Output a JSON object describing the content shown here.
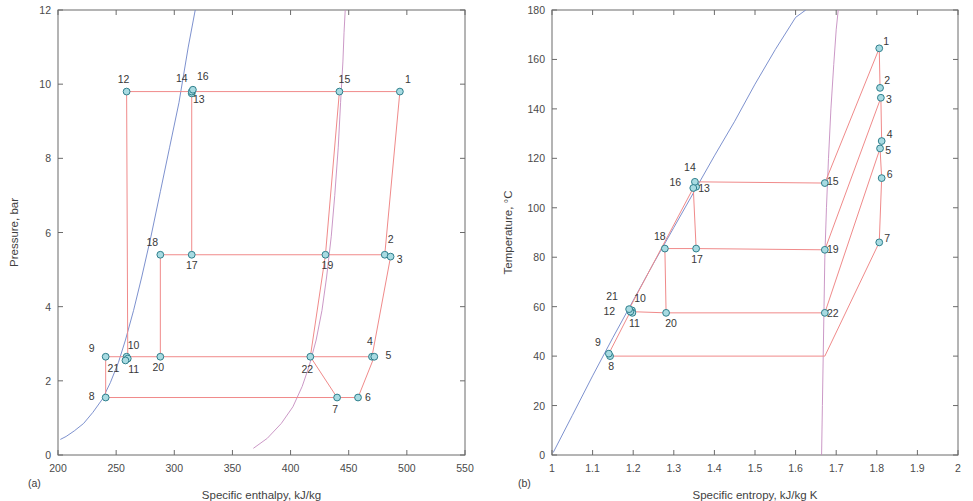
{
  "figure": {
    "panel_a_tag": "(a)",
    "panel_b_tag": "(b)"
  },
  "chart_data": [
    {
      "type": "line",
      "panel": "(a)",
      "title": "",
      "xlabel": "Specific enthalpy, kJ/kg",
      "ylabel": "Pressure, bar",
      "xlim": [
        200,
        550
      ],
      "ylim": [
        0,
        12
      ],
      "xticks": [
        200,
        250,
        300,
        350,
        400,
        450,
        500,
        550
      ],
      "yticks": [
        0,
        2,
        4,
        6,
        8,
        10,
        12
      ],
      "xtick_labels": [
        "200",
        "250",
        "300",
        "350",
        "400",
        "450",
        "500",
        "550"
      ],
      "ytick_labels": [
        "0",
        "2",
        "4",
        "6",
        "8",
        "10",
        "12"
      ],
      "grid": false,
      "legend": "none",
      "state_points": [
        {
          "label": "1",
          "x": 494,
          "y": 9.8,
          "lx": 8,
          "ly": -9
        },
        {
          "label": "2",
          "x": 481,
          "y": 5.4,
          "lx": 6,
          "ly": -12
        },
        {
          "label": "3",
          "x": 486,
          "y": 5.35,
          "lx": 9,
          "ly": 6
        },
        {
          "label": "4",
          "x": 470,
          "y": 2.65,
          "lx": -2,
          "ly": -12
        },
        {
          "label": "5",
          "x": 472,
          "y": 2.65,
          "lx": 14,
          "ly": 2
        },
        {
          "label": "6",
          "x": 458,
          "y": 1.55,
          "lx": 10,
          "ly": 3
        },
        {
          "label": "7",
          "x": 440,
          "y": 1.55,
          "lx": -2,
          "ly": 15
        },
        {
          "label": "8",
          "x": 241,
          "y": 1.55,
          "lx": -14,
          "ly": 2
        },
        {
          "label": "9",
          "x": 241,
          "y": 2.65,
          "lx": -14,
          "ly": -5
        },
        {
          "label": "10",
          "x": 259,
          "y": 2.65,
          "lx": 7,
          "ly": -8
        },
        {
          "label": "11",
          "x": 260,
          "y": 2.6,
          "lx": 6,
          "ly": 14
        },
        {
          "label": "12",
          "x": 259,
          "y": 9.8,
          "lx": -3,
          "ly": -9
        },
        {
          "label": "13",
          "x": 315,
          "y": 9.75,
          "lx": 7,
          "ly": 10
        },
        {
          "label": "14",
          "x": 315,
          "y": 9.8,
          "lx": -10,
          "ly": -10
        },
        {
          "label": "15",
          "x": 442,
          "y": 9.8,
          "lx": 5,
          "ly": -9
        },
        {
          "label": "16",
          "x": 316,
          "y": 9.85,
          "lx": 10,
          "ly": -10
        },
        {
          "label": "17",
          "x": 315,
          "y": 5.4,
          "lx": 0,
          "ly": 14
        },
        {
          "label": "18",
          "x": 288,
          "y": 5.4,
          "lx": -8,
          "ly": -9
        },
        {
          "label": "19",
          "x": 430,
          "y": 5.4,
          "lx": 2,
          "ly": 14
        },
        {
          "label": "20",
          "x": 288,
          "y": 2.65,
          "lx": -2,
          "ly": 14
        },
        {
          "label": "21",
          "x": 258,
          "y": 2.55,
          "lx": -12,
          "ly": 12
        },
        {
          "label": "22",
          "x": 417,
          "y": 2.65,
          "lx": -3,
          "ly": 16
        }
      ],
      "series": [
        {
          "name": "saturated-liquid-line",
          "color": "#6e84c8",
          "x": [
            202,
            207,
            214,
            222,
            230,
            238,
            245,
            252,
            258,
            265,
            272,
            280,
            288,
            296,
            304,
            312,
            318
          ],
          "y": [
            0.42,
            0.5,
            0.65,
            0.85,
            1.15,
            1.5,
            1.95,
            2.5,
            3.1,
            3.9,
            4.8,
            5.9,
            7.1,
            8.3,
            9.5,
            11.0,
            12.0
          ]
        },
        {
          "name": "saturated-vapour-line",
          "color": "#c58cc0",
          "x": [
            368,
            380,
            392,
            402,
            410,
            416,
            422,
            427,
            431,
            435,
            438,
            441,
            443,
            445,
            446,
            447
          ],
          "y": [
            0.18,
            0.45,
            0.85,
            1.3,
            1.85,
            2.4,
            3.1,
            3.9,
            4.8,
            5.9,
            7.0,
            8.3,
            9.5,
            10.6,
            11.4,
            12.0
          ]
        },
        {
          "name": "cycle-high-pressure-line",
          "color": "#f08a8a",
          "x": [
            259,
            315,
            442,
            494
          ],
          "y": [
            9.8,
            9.8,
            9.8,
            9.8
          ]
        },
        {
          "name": "cycle-mid-pressure-line",
          "color": "#f08a8a",
          "x": [
            288,
            315,
            430,
            481,
            486
          ],
          "y": [
            5.4,
            5.4,
            5.4,
            5.4,
            5.35
          ]
        },
        {
          "name": "cycle-low-pressure-line",
          "color": "#f08a8a",
          "x": [
            241,
            259,
            288,
            417,
            470,
            472
          ],
          "y": [
            2.65,
            2.65,
            2.65,
            2.65,
            2.65,
            2.65
          ]
        },
        {
          "name": "cycle-evaporator-line",
          "color": "#f08a8a",
          "x": [
            241,
            440,
            458
          ],
          "y": [
            1.55,
            1.55,
            1.55
          ]
        },
        {
          "name": "riser-12-11",
          "color": "#f08a8a",
          "x": [
            259,
            260
          ],
          "y": [
            9.8,
            2.6
          ]
        },
        {
          "name": "riser-14-17",
          "color": "#f08a8a",
          "x": [
            315,
            315
          ],
          "y": [
            9.8,
            5.4
          ]
        },
        {
          "name": "riser-18-20",
          "color": "#f08a8a",
          "x": [
            288,
            288
          ],
          "y": [
            5.4,
            2.65
          ]
        },
        {
          "name": "riser-9-8",
          "color": "#f08a8a",
          "x": [
            241,
            241
          ],
          "y": [
            2.65,
            1.55
          ]
        },
        {
          "name": "riser-1-2",
          "color": "#f08a8a",
          "x": [
            494,
            481
          ],
          "y": [
            9.8,
            5.4
          ]
        },
        {
          "name": "riser-3-4",
          "color": "#f08a8a",
          "x": [
            486,
            470
          ],
          "y": [
            5.35,
            2.65
          ]
        },
        {
          "name": "riser-5-6",
          "color": "#f08a8a",
          "x": [
            472,
            458
          ],
          "y": [
            2.65,
            1.55
          ]
        },
        {
          "name": "riser-15-19-22-7",
          "color": "#c58cc0",
          "x": [
            442,
            430,
            417,
            440
          ],
          "y": [
            9.8,
            5.4,
            2.65,
            1.55
          ]
        }
      ]
    },
    {
      "type": "line",
      "panel": "(b)",
      "title": "",
      "xlabel": "Specific entropy, kJ/kg K",
      "ylabel": "Temperature, °C",
      "xlim": [
        1,
        2
      ],
      "ylim": [
        0,
        180
      ],
      "xticks": [
        1,
        1.1,
        1.2,
        1.3,
        1.4,
        1.5,
        1.6,
        1.7,
        1.8,
        1.9,
        2
      ],
      "yticks": [
        0,
        20,
        40,
        60,
        80,
        100,
        120,
        140,
        160,
        180
      ],
      "xtick_labels": [
        "1",
        "1.1",
        "1.2",
        "1.3",
        "1.4",
        "1.5",
        "1.6",
        "1.7",
        "1.8",
        "1.9",
        "2"
      ],
      "ytick_labels": [
        "0",
        "20",
        "40",
        "60",
        "80",
        "100",
        "120",
        "140",
        "160",
        "180"
      ],
      "grid": false,
      "legend": "none",
      "state_points": [
        {
          "label": "1",
          "x": 1.806,
          "y": 164.5,
          "lx": 7,
          "ly": -3
        },
        {
          "label": "2",
          "x": 1.808,
          "y": 148.5,
          "lx": 7,
          "ly": -4
        },
        {
          "label": "3",
          "x": 1.81,
          "y": 144.5,
          "lx": 8,
          "ly": 5
        },
        {
          "label": "4",
          "x": 1.812,
          "y": 127.0,
          "lx": 8,
          "ly": -3
        },
        {
          "label": "5",
          "x": 1.808,
          "y": 124.0,
          "lx": 8,
          "ly": 6
        },
        {
          "label": "6",
          "x": 1.812,
          "y": 112.0,
          "lx": 8,
          "ly": 0
        },
        {
          "label": "7",
          "x": 1.806,
          "y": 86.0,
          "lx": 8,
          "ly": 0
        },
        {
          "label": "8",
          "x": 1.143,
          "y": 40.0,
          "lx": 1,
          "ly": 14
        },
        {
          "label": "9",
          "x": 1.14,
          "y": 41.0,
          "lx": -11,
          "ly": -8
        },
        {
          "label": "10",
          "x": 1.197,
          "y": 58.5,
          "lx": 8,
          "ly": -8
        },
        {
          "label": "11",
          "x": 1.198,
          "y": 57.5,
          "lx": 2,
          "ly": 14
        },
        {
          "label": "12",
          "x": 1.193,
          "y": 58.0,
          "lx": -21,
          "ly": 3
        },
        {
          "label": "13",
          "x": 1.355,
          "y": 108.5,
          "lx": 8,
          "ly": 5
        },
        {
          "label": "14",
          "x": 1.352,
          "y": 110.5,
          "lx": -5,
          "ly": -11
        },
        {
          "label": "15",
          "x": 1.672,
          "y": 110.0,
          "lx": 8,
          "ly": 2
        },
        {
          "label": "16",
          "x": 1.348,
          "y": 108.0,
          "lx": -18,
          "ly": -2
        },
        {
          "label": "17",
          "x": 1.355,
          "y": 83.5,
          "lx": 1,
          "ly": 14
        },
        {
          "label": "18",
          "x": 1.278,
          "y": 83.5,
          "lx": -5,
          "ly": -9
        },
        {
          "label": "19",
          "x": 1.672,
          "y": 83.0,
          "lx": 8,
          "ly": 3
        },
        {
          "label": "20",
          "x": 1.281,
          "y": 57.5,
          "lx": 5,
          "ly": 14
        },
        {
          "label": "21",
          "x": 1.19,
          "y": 59.0,
          "lx": -17,
          "ly": -9
        },
        {
          "label": "22",
          "x": 1.672,
          "y": 57.5,
          "lx": 8,
          "ly": 4
        }
      ],
      "series": [
        {
          "name": "saturated-liquid-line",
          "color": "#6e84c8",
          "x": [
            1.003,
            1.05,
            1.1,
            1.15,
            1.2,
            1.25,
            1.3,
            1.35,
            1.4,
            1.45,
            1.5,
            1.55,
            1.6,
            1.625
          ],
          "y": [
            1.0,
            16.0,
            32.0,
            47.5,
            62.5,
            77.5,
            92.0,
            106.5,
            121.0,
            135.0,
            150.0,
            164.0,
            177.0,
            180.0
          ]
        },
        {
          "name": "saturated-vapour-line",
          "color": "#c58cc0",
          "x": [
            1.664,
            1.666,
            1.668,
            1.67,
            1.672,
            1.676,
            1.681,
            1.687,
            1.694,
            1.7,
            1.705
          ],
          "y": [
            0.0,
            20.0,
            40.0,
            60.0,
            80.0,
            100.0,
            120.0,
            140.0,
            158.0,
            172.0,
            180.0
          ]
        },
        {
          "name": "cycle-generator-line",
          "color": "#f08a8a",
          "x": [
            1.352,
            1.672
          ],
          "y": [
            110.5,
            110.0
          ]
        },
        {
          "name": "cycle-mid-line",
          "color": "#f08a8a",
          "x": [
            1.278,
            1.355,
            1.672
          ],
          "y": [
            83.5,
            83.5,
            83.0
          ]
        },
        {
          "name": "cycle-absorber-line",
          "color": "#f08a8a",
          "x": [
            1.193,
            1.281,
            1.672
          ],
          "y": [
            58.0,
            57.5,
            57.5
          ]
        },
        {
          "name": "cycle-evaporator-line",
          "color": "#f08a8a",
          "x": [
            1.143,
            1.672
          ],
          "y": [
            40.0,
            40.0
          ]
        },
        {
          "name": "riser-16-17",
          "color": "#f08a8a",
          "x": [
            1.348,
            1.355
          ],
          "y": [
            108.0,
            83.5
          ]
        },
        {
          "name": "riser-18-20",
          "color": "#f08a8a",
          "x": [
            1.278,
            1.281
          ],
          "y": [
            83.5,
            57.5
          ]
        },
        {
          "name": "riser-9-8",
          "color": "#f08a8a",
          "x": [
            1.14,
            1.143
          ],
          "y": [
            41.0,
            40.0
          ]
        },
        {
          "name": "riser-12-9",
          "color": "#f08a8a",
          "x": [
            1.193,
            1.14
          ],
          "y": [
            58.0,
            41.0
          ]
        },
        {
          "name": "riser-21-14",
          "color": "#f08a8a",
          "x": [
            1.19,
            1.348
          ],
          "y": [
            59.0,
            108.0
          ]
        },
        {
          "name": "riser-1-2",
          "color": "#f08a8a",
          "x": [
            1.806,
            1.808
          ],
          "y": [
            164.5,
            148.5
          ]
        },
        {
          "name": "riser-3-4",
          "color": "#f08a8a",
          "x": [
            1.81,
            1.812
          ],
          "y": [
            144.5,
            127.0
          ]
        },
        {
          "name": "riser-5-6",
          "color": "#f08a8a",
          "x": [
            1.808,
            1.812
          ],
          "y": [
            124.0,
            112.0
          ]
        },
        {
          "name": "riser-6-7",
          "color": "#c58cc0",
          "x": [
            1.812,
            1.806
          ],
          "y": [
            112.0,
            86.0
          ]
        },
        {
          "name": "riser-15-1",
          "color": "#f08a8a",
          "x": [
            1.672,
            1.806
          ],
          "y": [
            110.0,
            164.5
          ]
        },
        {
          "name": "riser-19-3",
          "color": "#f08a8a",
          "x": [
            1.672,
            1.81
          ],
          "y": [
            83.0,
            144.5
          ]
        },
        {
          "name": "riser-22-5",
          "color": "#f08a8a",
          "x": [
            1.672,
            1.808
          ],
          "y": [
            57.5,
            124.0
          ]
        },
        {
          "name": "riser-evap-7",
          "color": "#f08a8a",
          "x": [
            1.672,
            1.806
          ],
          "y": [
            40.0,
            86.0
          ]
        }
      ]
    }
  ]
}
